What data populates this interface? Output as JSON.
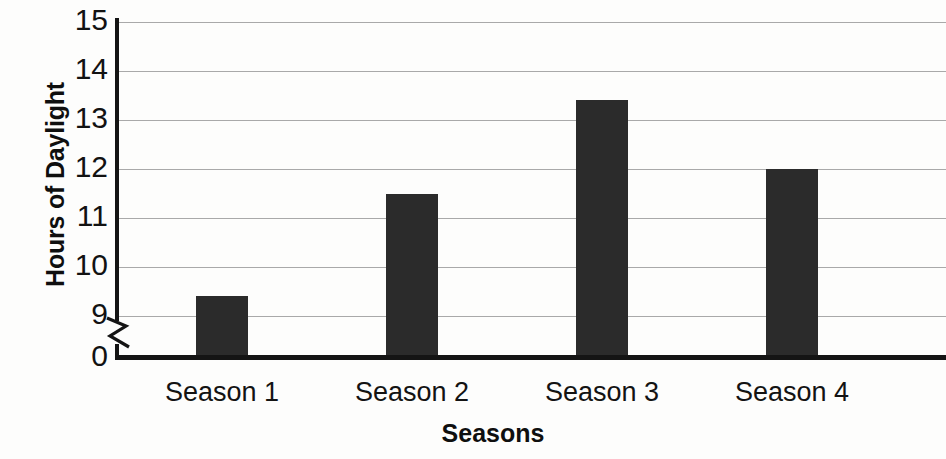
{
  "chart_data": {
    "type": "bar",
    "title": "",
    "xlabel": "Seasons",
    "ylabel": "Hours of Daylight",
    "categories": [
      "Season 1",
      "Season 2",
      "Season 3",
      "Season 4"
    ],
    "values": [
      9.4,
      11.5,
      13.4,
      12.0
    ],
    "series": [
      {
        "name": "Hours of Daylight",
        "values": [
          9.4,
          11.5,
          13.4,
          12.0
        ]
      }
    ],
    "ytick_labels": [
      "15",
      "14",
      "13",
      "12",
      "11",
      "10",
      "9",
      "0"
    ],
    "ytick_values": [
      15,
      14,
      13,
      12,
      11,
      10,
      9,
      0
    ],
    "ylim": [
      9,
      15
    ],
    "y_axis_break": true,
    "y_axis_break_between": [
      0,
      9
    ],
    "grid": "horizontal",
    "legend": "none",
    "bar_color": "#2b2b2b",
    "gridline_color": "#9a9a9a",
    "axis_color": "#141414",
    "background_color": "#fdfdfc"
  },
  "axes": {
    "y_title": "Hours of Daylight",
    "x_title": "Seasons"
  }
}
